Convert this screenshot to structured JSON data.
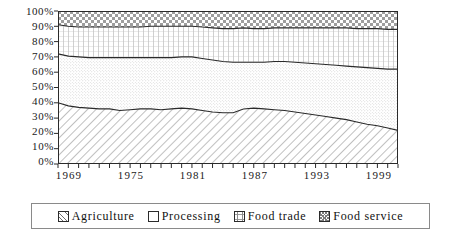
{
  "chart_data": {
    "type": "area",
    "stacked": true,
    "title": "",
    "subtitle": "",
    "xlabel": "",
    "ylabel": "",
    "grid": false,
    "legend_position": "bottom",
    "xlim": [
      1969,
      2002
    ],
    "ylim": [
      0,
      100
    ],
    "y_tick_labels": [
      "100%",
      "90%",
      "80%",
      "70%",
      "60%",
      "50%",
      "40%",
      "30%",
      "20%",
      "10%",
      "0%"
    ],
    "y_ticks": [
      100,
      90,
      80,
      70,
      60,
      50,
      40,
      30,
      20,
      10,
      0
    ],
    "x_tick_labels": [
      "1969",
      "1975",
      "1981",
      "1987",
      "1993",
      "1999"
    ],
    "x_ticks": [
      1969,
      1975,
      1981,
      1987,
      1993,
      1999
    ],
    "x": [
      1969,
      1970,
      1971,
      1972,
      1973,
      1974,
      1975,
      1976,
      1977,
      1978,
      1979,
      1980,
      1981,
      1982,
      1983,
      1984,
      1985,
      1986,
      1987,
      1988,
      1989,
      1990,
      1991,
      1992,
      1993,
      1994,
      1995,
      1996,
      1997,
      1998,
      1999,
      2000,
      2001,
      2002
    ],
    "series": [
      {
        "name": "Agriculture",
        "pattern": "diagonal-hatch",
        "values": [
          40,
          38,
          37,
          36.5,
          36,
          36,
          35,
          35.5,
          36,
          36,
          35.5,
          36,
          36.5,
          36,
          35,
          34,
          33.5,
          33.5,
          36,
          36.5,
          36,
          35.5,
          35,
          34,
          33,
          32,
          31,
          30,
          29,
          27.5,
          26,
          25,
          23.5,
          22
        ]
      },
      {
        "name": "Processing",
        "pattern": "fine-dots",
        "values": [
          32,
          32.5,
          33,
          33,
          33.5,
          33.5,
          34.5,
          34,
          33.5,
          33.5,
          34,
          33.5,
          33.5,
          34,
          34,
          34,
          33.5,
          33,
          30.5,
          30,
          30.5,
          31.5,
          32,
          32.5,
          33,
          33.5,
          34,
          34.5,
          35,
          36,
          37,
          37.5,
          38.5,
          40
        ]
      },
      {
        "name": "Food trade",
        "pattern": "vertical-grid",
        "values": [
          19,
          19.5,
          19.5,
          20,
          20,
          20,
          20,
          20,
          20,
          20.5,
          20.5,
          20.5,
          20,
          20,
          20.5,
          21,
          21.5,
          22,
          22.5,
          22,
          22,
          22,
          22,
          22.5,
          23,
          23.5,
          24,
          24.5,
          25,
          25,
          25.5,
          26,
          26,
          26
        ]
      },
      {
        "name": "Food service",
        "pattern": "checker-crosshatch",
        "values": [
          9,
          10,
          10.5,
          10.5,
          10.5,
          10.5,
          10.5,
          10.5,
          10.5,
          10,
          10,
          10,
          10,
          10,
          10.5,
          11,
          11.5,
          11.5,
          11,
          11.5,
          11.5,
          11,
          11,
          11,
          11,
          11,
          11,
          11,
          11,
          11.5,
          11.5,
          11.5,
          12,
          12
        ]
      }
    ],
    "cumulative_top_percent": {
      "agriculture_top": [
        40,
        38,
        37,
        36.5,
        36,
        36,
        35,
        35.5,
        36,
        36,
        35.5,
        36,
        36.5,
        36,
        35,
        34,
        33.5,
        33.5,
        36,
        36.5,
        36,
        35.5,
        35,
        34,
        33,
        32,
        31,
        30,
        29,
        27.5,
        26,
        25,
        23.5,
        22
      ],
      "processing_top": [
        72,
        70.5,
        70,
        69.5,
        69.5,
        69.5,
        69.5,
        69.5,
        69.5,
        69.5,
        69.5,
        69.5,
        70,
        70,
        69,
        68,
        67,
        66.5,
        66.5,
        66.5,
        66.5,
        67,
        67,
        66.5,
        66,
        65.5,
        65,
        64.5,
        64,
        63.5,
        63,
        62.5,
        62,
        62
      ],
      "food_trade_top": [
        91,
        90,
        89.5,
        89.5,
        89.5,
        89.5,
        89.5,
        89.5,
        89.5,
        90,
        90,
        90,
        90,
        90,
        89.5,
        89,
        88.5,
        88.5,
        89,
        88.5,
        88.5,
        89,
        89,
        89,
        89,
        89,
        89,
        89,
        89,
        88.5,
        88.5,
        88.5,
        88,
        88
      ],
      "food_service_top": [
        100,
        100,
        100,
        100,
        100,
        100,
        100,
        100,
        100,
        100,
        100,
        100,
        100,
        100,
        100,
        100,
        100,
        100,
        100,
        100,
        100,
        100,
        100,
        100,
        100,
        100,
        100,
        100,
        100,
        100,
        100,
        100,
        100,
        100
      ]
    }
  },
  "legend": {
    "items": [
      {
        "label": "Agriculture",
        "swatch": "diagonal-hatch-swatch"
      },
      {
        "label": "Processing",
        "swatch": "fine-dots-swatch"
      },
      {
        "label": "Food trade",
        "swatch": "vertical-grid-swatch"
      },
      {
        "label": "Food service",
        "swatch": "checker-crosshatch-swatch"
      }
    ]
  },
  "colors": {
    "axis": "#1a1a1a",
    "series_outline": "#222222",
    "legend_border": "#8a8a8a",
    "background": "#ffffff",
    "pattern_ink": "#7d7d7d"
  }
}
